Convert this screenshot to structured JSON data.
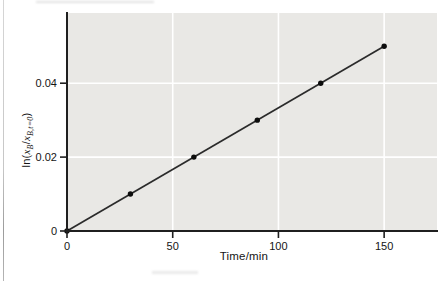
{
  "figure": {
    "background": "#ffffff",
    "plot_background": "#e9e8e5",
    "grid_color": "#ffffff",
    "axis_color": "#1f1f1f",
    "line_color": "#2b2b2b",
    "point_color": "#0d0d0d",
    "tick_label_color": "#151515"
  },
  "chart_data": {
    "type": "scatter",
    "title": "",
    "xlabel": "Time/min",
    "ylabel": "ln(x_B/x_B,t=0)",
    "ylabel_parts": {
      "fn": "ln(",
      "x1": "x",
      "sub1": "B",
      "slash": "/",
      "x2": "x",
      "sub2": "B,t=0",
      "close": ")"
    },
    "x": [
      0,
      30,
      60,
      90,
      120,
      150
    ],
    "y": [
      0,
      0.01,
      0.02,
      0.03,
      0.04,
      0.05
    ],
    "fit_line": {
      "x0": 0,
      "y0": 0,
      "x1": 150,
      "y1": 0.05
    },
    "xlim": [
      0,
      175
    ],
    "ylim": [
      0,
      0.059
    ],
    "xticks": [
      0,
      50,
      100,
      150
    ],
    "xtick_labels": [
      "0",
      "50",
      "100",
      "150"
    ],
    "yticks": [
      0,
      0.02,
      0.04
    ],
    "ytick_labels": [
      "0",
      "0.02",
      "0.04"
    ],
    "grid": true,
    "legend": "none"
  }
}
